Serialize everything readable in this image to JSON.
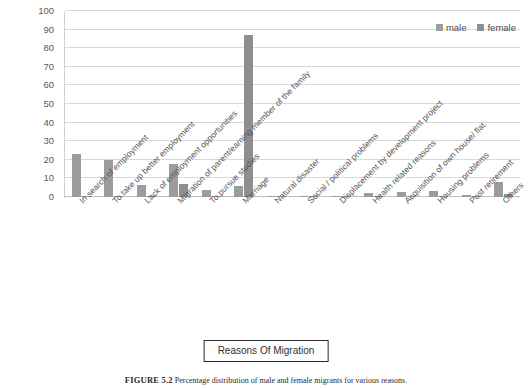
{
  "chart_data": {
    "type": "bar",
    "title": "",
    "xlabel": "Reasons Of Migration",
    "ylabel": "",
    "ylim": [
      0,
      100
    ],
    "yticks": [
      0,
      10,
      20,
      30,
      40,
      50,
      60,
      70,
      80,
      90,
      100
    ],
    "grid": true,
    "legend_position": "top-right",
    "categories": [
      "In search of employment",
      "To take up better employment",
      "Lack of employment opportunities",
      "Migration of parent/earning member of the family",
      "To pursue studies",
      "Marriage",
      "Natural disaster",
      "Social / political problems",
      "Displacement by development project",
      "Health related reasons",
      "Acquisition of own house/ flat.",
      "Housing problems",
      "Post retirement",
      "Others"
    ],
    "series": [
      {
        "name": "male",
        "color": "#9c9c9c",
        "values": [
          23,
          20,
          6.5,
          17.5,
          4,
          6,
          0.3,
          0.3,
          0.2,
          2,
          2.5,
          3.5,
          1.2,
          8
        ]
      },
      {
        "name": "female",
        "color": "#8f8f8f",
        "values": [
          0.6,
          0.7,
          0.4,
          7,
          0.4,
          87,
          0.2,
          0.2,
          0.1,
          0.3,
          0.5,
          0.7,
          0.3,
          1.4
        ]
      }
    ]
  },
  "legend": {
    "items": [
      {
        "label": "male"
      },
      {
        "label": "female"
      }
    ]
  },
  "axis_title": {
    "text": "Reasons Of Migration"
  },
  "caption": {
    "figure_number": "FIGURE 5.2",
    "text": "Percentage distribution of male and female migrants for various reasons."
  },
  "colors": {
    "male": "#9c9c9c",
    "female": "#8f8f8f",
    "gridline": "#d9d9d9",
    "text": "#575757"
  }
}
